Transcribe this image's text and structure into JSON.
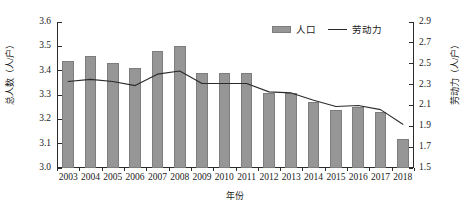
{
  "chart_data": {
    "type": "bar",
    "title": "",
    "subtitle": "",
    "xlabel": "年份",
    "ylabel": "总人数（人/户）",
    "ylabel_right": "劳动力（人/户）",
    "grid": false,
    "legend_position": "top-right",
    "categories": [
      "2003",
      "2004",
      "2005",
      "2006",
      "2007",
      "2008",
      "2009",
      "2010",
      "2011",
      "2012",
      "2013",
      "2014",
      "2015",
      "2016",
      "2017",
      "2018"
    ],
    "ylim": [
      3.0,
      3.6
    ],
    "yticks": [
      "3.0",
      "3.1",
      "3.2",
      "3.3",
      "3.4",
      "3.5",
      "3.6"
    ],
    "ylim_right": [
      1.5,
      2.9
    ],
    "yticks_right": [
      "1.5",
      "1.7",
      "1.9",
      "2.1",
      "2.3",
      "2.5",
      "2.7",
      "2.9"
    ],
    "series": [
      {
        "name": "人口",
        "kind": "bar",
        "axis": "left",
        "color": "#969696",
        "values": [
          3.44,
          3.46,
          3.43,
          3.41,
          3.48,
          3.5,
          3.39,
          3.39,
          3.39,
          3.31,
          3.31,
          3.27,
          3.24,
          3.25,
          3.23,
          3.12
        ]
      },
      {
        "name": "劳动力",
        "kind": "line",
        "axis": "right",
        "color": "#2b2b2b",
        "values": [
          2.33,
          2.35,
          2.33,
          2.29,
          2.4,
          2.43,
          2.31,
          2.31,
          2.31,
          2.23,
          2.22,
          2.15,
          2.09,
          2.1,
          2.06,
          1.92
        ]
      }
    ]
  },
  "legend": {
    "items": [
      {
        "label": "人口",
        "marker": "bar-swatch"
      },
      {
        "label": "劳动力",
        "marker": "line-swatch"
      }
    ]
  },
  "axes": {
    "x_title": "年份",
    "y_title_left": "总人数（人/户）",
    "y_title_right": "劳动力（人/户）"
  }
}
